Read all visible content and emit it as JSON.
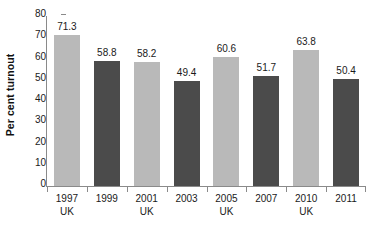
{
  "chart_data": {
    "type": "bar",
    "title": "",
    "xlabel": "",
    "ylabel": "Per cent turnout",
    "ylim": [
      0,
      80
    ],
    "yticks": [
      0,
      10,
      20,
      30,
      40,
      50,
      60,
      70,
      80
    ],
    "ytick_labels": [
      "0",
      "10",
      "20",
      "30",
      "40",
      "50",
      "60",
      "70",
      "80"
    ],
    "grid": false,
    "legend": "none",
    "categories": [
      "1997",
      "1999",
      "2001",
      "2003",
      "2005",
      "2007",
      "2010",
      "2011"
    ],
    "category_sublabels": [
      "UK",
      "",
      "UK",
      "",
      "UK",
      "",
      "UK",
      ""
    ],
    "values": [
      71.3,
      58.8,
      58.2,
      49.4,
      60.6,
      51.7,
      63.8,
      50.4
    ],
    "value_labels": [
      "71.3",
      "58.8",
      "58.2",
      "49.4",
      "60.6",
      "51.7",
      "63.8",
      "50.4"
    ],
    "bar_styles": [
      "light",
      "dark",
      "light",
      "dark",
      "light",
      "dark",
      "light",
      "dark"
    ],
    "colors": {
      "light_bar": "#b9b9b9",
      "dark_bar": "#4b4b4b",
      "axis": "#8a8a8a",
      "text": "#1a1a1a",
      "background": "#ffffff"
    }
  }
}
